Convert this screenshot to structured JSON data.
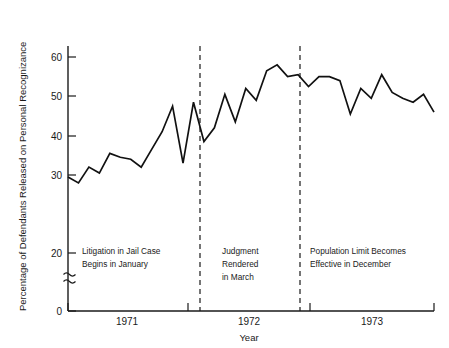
{
  "chart_data": {
    "type": "line",
    "title": "",
    "xlabel": "Year",
    "ylabel": "Percentage of Defendants Released on Personal Recognizance",
    "ylim": [
      0,
      65
    ],
    "y_axis_break": true,
    "y_break_between": [
      0,
      20
    ],
    "yticks": [
      0,
      20,
      30,
      40,
      50,
      60
    ],
    "ytick_labels": [
      "0",
      "20",
      "30",
      "40",
      "50",
      "60"
    ],
    "grid": false,
    "legend": "none",
    "x_tick_years": [
      "1971",
      "1972",
      "1973"
    ],
    "x_axis_range": [
      "1971-01",
      "1973-12"
    ],
    "x": [
      "1971-01",
      "1971-02",
      "1971-03",
      "1971-04",
      "1971-05",
      "1971-06",
      "1971-07",
      "1971-08",
      "1971-09",
      "1971-10",
      "1971-11",
      "1971-12",
      "1972-01",
      "1972-02",
      "1972-03",
      "1972-04",
      "1972-05",
      "1972-06",
      "1972-07",
      "1972-08",
      "1972-09",
      "1972-10",
      "1972-11",
      "1972-12",
      "1973-01",
      "1973-02",
      "1973-03",
      "1973-04",
      "1973-05",
      "1973-06",
      "1973-07",
      "1973-08",
      "1973-09",
      "1973-10",
      "1973-11",
      "1973-12"
    ],
    "values": [
      29.5,
      28.0,
      32.0,
      30.5,
      35.5,
      34.5,
      34.0,
      32.0,
      36.5,
      41.0,
      47.5,
      33.0,
      48.5,
      38.5,
      42.0,
      50.5,
      43.5,
      52.0,
      49.0,
      56.5,
      58.0,
      55.0,
      55.5,
      52.5,
      55.0,
      55.0,
      54.0,
      45.5,
      52.0,
      49.5,
      55.5,
      51.0,
      49.5,
      48.5,
      50.5,
      46.0
    ],
    "series": [
      {
        "name": "Percentage Released on Personal Recognizance",
        "values": [
          29.5,
          28.0,
          32.0,
          30.5,
          35.5,
          34.5,
          34.0,
          32.0,
          36.5,
          41.0,
          47.5,
          33.0,
          48.5,
          38.5,
          42.0,
          50.5,
          43.5,
          52.0,
          49.0,
          56.5,
          58.0,
          55.0,
          55.5,
          52.5,
          55.0,
          55.0,
          54.0,
          45.5,
          52.0,
          49.5,
          55.5,
          51.0,
          49.5,
          48.5,
          50.5,
          46.0
        ]
      }
    ],
    "annotations": [
      {
        "id": "litigation-begins",
        "lines": [
          "Litigation in Jail Case",
          "Begins in January"
        ],
        "marker_x": "1972-01",
        "marker_type": "vertical-dashed-line"
      },
      {
        "id": "judgment-rendered",
        "lines": [
          "Judgment",
          "Rendered",
          "in March"
        ],
        "marker_x": "1972-12",
        "marker_type": "vertical-dashed-line"
      },
      {
        "id": "population-limit",
        "lines": [
          "Population Limit Becomes",
          "Effective in December"
        ],
        "marker_type": "text-only"
      }
    ]
  },
  "axis": {
    "y_title": "Percentage of Defendants Released on Personal Recognizance",
    "x_title": "Year",
    "ytick_0": "0",
    "ytick_20": "20",
    "ytick_30": "30",
    "ytick_40": "40",
    "ytick_50": "50",
    "ytick_60": "60",
    "year_1971": "1971",
    "year_1972": "1972",
    "year_1973": "1973"
  },
  "annotations": {
    "left": {
      "line1": "Litigation in Jail Case",
      "line2": "Begins in January"
    },
    "middle": {
      "line1": "Judgment",
      "line2": "Rendered",
      "line3": "in March"
    },
    "right": {
      "line1": "Population Limit Becomes",
      "line2": "Effective in December"
    }
  },
  "colors": {
    "line": "#111111",
    "axis": "#1a1a1a",
    "background": "#ffffff"
  }
}
